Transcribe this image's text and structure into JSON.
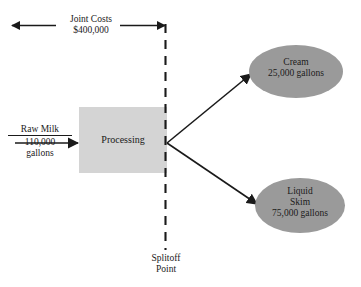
{
  "diagram": {
    "colors": {
      "stroke": "#1a1a1a",
      "process_box_fill": "#d4d4d4",
      "product_ellipse_fill": "#9a9a9a",
      "background": "#ffffff"
    },
    "joint_costs": {
      "label": "Joint Costs",
      "amount": "$400,000",
      "arrow_type": "double-headed-horizontal"
    },
    "input": {
      "name": "Raw Milk",
      "quantity": "110,000",
      "unit": "gallons"
    },
    "process": {
      "label": "Processing"
    },
    "splitoff": {
      "line1": "Splitoff",
      "line2": "Point",
      "line_style": "dashed-vertical"
    },
    "outputs": [
      {
        "name": "Cream",
        "quantity_line": "25,000 gallons",
        "shape": "ellipse"
      },
      {
        "name_line1": "Liquid",
        "name_line2": "Skim",
        "quantity_line": "75,000 gallons",
        "shape": "ellipse"
      }
    ]
  }
}
